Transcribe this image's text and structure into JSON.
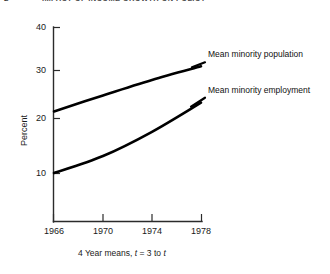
{
  "header": {
    "folio": "2",
    "running_title": "IMPACT OF INCOME GROWTH ON POLICY"
  },
  "chart_data": {
    "type": "line",
    "title": "",
    "xlabel": "4 Year means, t = 3 to t",
    "ylabel": "Percent",
    "x": [
      1966,
      1970,
      1974,
      1978
    ],
    "xlim": [
      1966,
      1978
    ],
    "ylim": [
      0,
      40
    ],
    "xticks": [
      "1966",
      "1970",
      "1974",
      "1978"
    ],
    "yticks": [
      "10",
      "20",
      "30",
      "40"
    ],
    "ytick_values": [
      10,
      20,
      30,
      40
    ],
    "grid": false,
    "legend_position": "inline-right",
    "series": [
      {
        "name": "Mean minority population",
        "values": [
          22.7,
          26.0,
          29.2,
          32.0
        ]
      },
      {
        "name": "Mean minority employment",
        "values": [
          10.0,
          13.5,
          18.5,
          24.5
        ]
      }
    ]
  },
  "caption": {
    "prefix": "4 Year means,",
    "var1": "t",
    "mid": "= 3 to",
    "var2": "t"
  }
}
